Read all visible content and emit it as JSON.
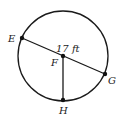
{
  "diagram": {
    "type": "circle-geometry",
    "circle": {
      "center": "F"
    },
    "points": [
      {
        "name": "E",
        "label": "E"
      },
      {
        "name": "F",
        "label": "F"
      },
      {
        "name": "G",
        "label": "G"
      },
      {
        "name": "H",
        "label": "H"
      }
    ],
    "segments": [
      {
        "from": "E",
        "to": "G",
        "kind": "diameter"
      },
      {
        "from": "F",
        "to": "H",
        "kind": "radius"
      }
    ],
    "measure_label": "17 ft",
    "colors": {
      "stroke": "#1a1a1a",
      "background": "#ffffff"
    }
  }
}
